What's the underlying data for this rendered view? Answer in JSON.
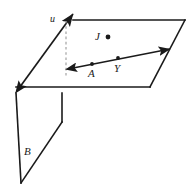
{
  "figure": {
    "kind": "geometry-diagram",
    "background_color": "#ffffff",
    "stroke_color": "#1a1a1a",
    "dashed_color": "#9a9a9a",
    "labels": {
      "plane_top_vector": "u",
      "point_j": "J",
      "point_a": "A",
      "point_y": "Y",
      "plane_vertical": "B"
    },
    "points": [
      {
        "name": "J",
        "label": "J",
        "x": 108,
        "y": 37
      },
      {
        "name": "A",
        "label": "A",
        "x": 92,
        "y": 64
      },
      {
        "name": "Y",
        "label": "Y",
        "x": 118,
        "y": 58
      }
    ],
    "shapes": {
      "top_plane": {
        "name": "horizontal-plane",
        "vertices": [
          [
            73,
            20
          ],
          [
            185,
            20
          ],
          [
            150,
            87
          ],
          [
            16,
            87
          ]
        ]
      },
      "vertical_plane": {
        "name": "vertical-plane",
        "vertices": [
          [
            16,
            93
          ],
          [
            62,
            93
          ],
          [
            62,
            122
          ],
          [
            21,
            183
          ]
        ]
      },
      "line_through_points": {
        "name": "line-AY",
        "from": [
          66,
          70
        ],
        "to": [
          172,
          48
        ],
        "double_headed": true
      },
      "edge_vector": {
        "name": "edge-vector-u",
        "from": [
          15,
          93
        ],
        "to": [
          74,
          12
        ],
        "double_headed": true
      },
      "dashed_drop": {
        "name": "dashed-drop-line",
        "from": [
          66,
          20
        ],
        "to": [
          66,
          76
        ]
      }
    }
  }
}
